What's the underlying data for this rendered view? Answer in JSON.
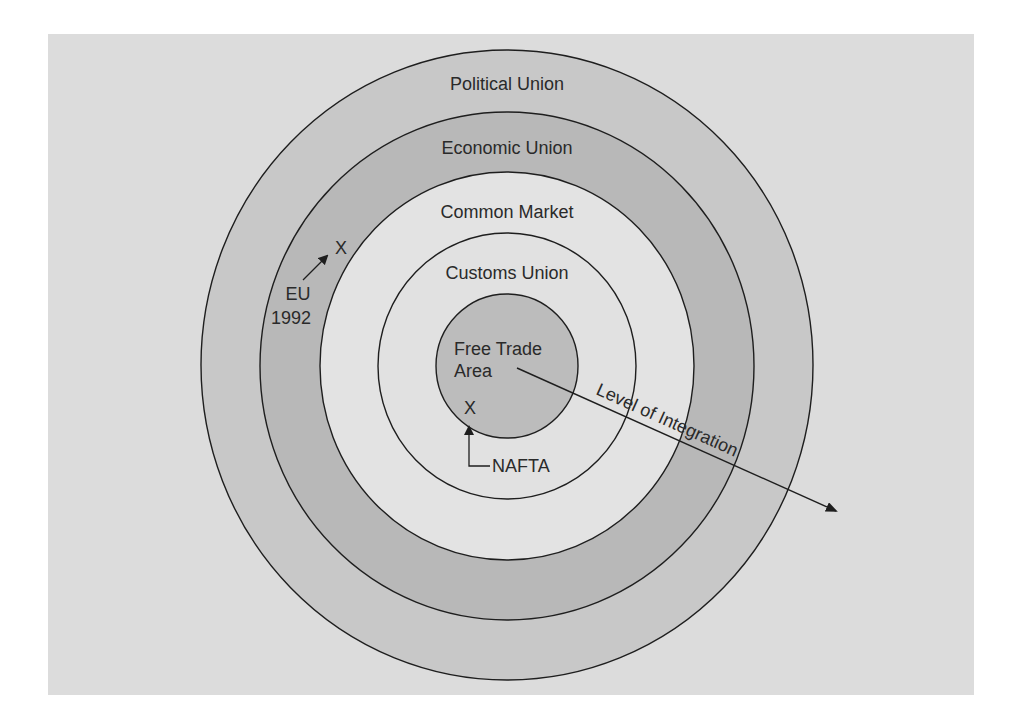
{
  "diagram": {
    "type": "concentric-circles",
    "title": "",
    "colors": {
      "panel_bg": "#dcdcdc",
      "outline": "#1e1e1e",
      "text": "#2a2a2a",
      "ring_political": "#c9c9c9",
      "ring_economic": "#b9b9b9",
      "ring_common_market": "#e4e4e4",
      "ring_customs_union": "#e1e1e1",
      "ring_free_trade_area": "#bdbdbd"
    },
    "rings": [
      {
        "id": "political-union",
        "label": "Political Union",
        "order": 5
      },
      {
        "id": "economic-union",
        "label": "Economic Union",
        "order": 4
      },
      {
        "id": "common-market",
        "label": "Common Market",
        "order": 3
      },
      {
        "id": "customs-union",
        "label": "Customs Union",
        "order": 2
      },
      {
        "id": "free-trade-area",
        "label_line1": "Free Trade",
        "label_line2": "Area",
        "order": 1
      }
    ],
    "axis": {
      "label": "Level of Integration",
      "direction": "outward from center"
    },
    "markers": [
      {
        "id": "eu",
        "symbol": "X",
        "label_line1": "EU",
        "label_line2": "1992",
        "ring": "Economic Union (boundary of Common Market)"
      },
      {
        "id": "nafta",
        "symbol": "X",
        "label": "NAFTA",
        "ring": "Free Trade Area"
      }
    ]
  }
}
